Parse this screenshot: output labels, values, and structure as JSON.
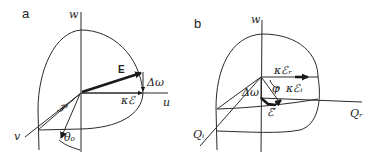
{
  "figure": {
    "panels": [
      {
        "id": "a",
        "label": "a",
        "axes": {
          "vertical": "w",
          "horizontal": "u",
          "diagonal": "v"
        },
        "vectors": {
          "field": "E",
          "projection": "κℰ",
          "detuning": "Δω",
          "polarization": "𝒫⃗"
        },
        "angle": "θ₀"
      },
      {
        "id": "b",
        "label": "b",
        "axes": {
          "vertical": "w",
          "horizontal": "Qᵣ",
          "diagonal": "Qᵢ"
        },
        "vectors": {
          "real_component": "κℰᵣ",
          "imag_component": "κℰᵢ",
          "detuning": "Δω",
          "field": "ℰ⃗"
        },
        "angle": "φ"
      }
    ]
  }
}
